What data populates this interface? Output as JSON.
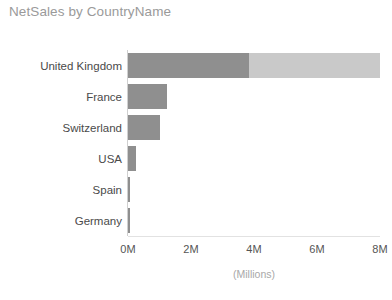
{
  "chart_data": {
    "type": "bar",
    "orientation": "horizontal",
    "title": "NetSales by CountryName",
    "xlabel": "(Millions)",
    "ylabel": "",
    "xlim": [
      0,
      8
    ],
    "xticks": [
      {
        "value": 0,
        "label": "0M"
      },
      {
        "value": 2,
        "label": "2M"
      },
      {
        "value": 4,
        "label": "4M"
      },
      {
        "value": 6,
        "label": "6M"
      },
      {
        "value": 8,
        "label": "8M"
      }
    ],
    "grid": false,
    "legend": "none",
    "units": "Millions",
    "categories": [
      "United Kingdom",
      "France",
      "Switzerland",
      "USA",
      "Spain",
      "Germany"
    ],
    "values": [
      8.0,
      1.25,
      1.0,
      0.26,
      0.06,
      0.05
    ],
    "series": [
      {
        "name": "NetSales (dark segment)",
        "color": "#8f8f8f",
        "values": [
          3.85,
          1.25,
          1.0,
          0.26,
          0.06,
          0.05
        ]
      },
      {
        "name": "NetSales (light segment)",
        "color": "#c9c9c9",
        "values": [
          4.15,
          0,
          0,
          0,
          0,
          0
        ]
      }
    ],
    "bars": [
      {
        "category": "United Kingdom",
        "total": 8.0,
        "dark": 3.85,
        "light": 4.15
      },
      {
        "category": "France",
        "total": 1.25,
        "dark": 1.25,
        "light": 0
      },
      {
        "category": "Switzerland",
        "total": 1.0,
        "dark": 1.0,
        "light": 0
      },
      {
        "category": "USA",
        "total": 0.26,
        "dark": 0.26,
        "light": 0
      },
      {
        "category": "Spain",
        "total": 0.06,
        "dark": 0.06,
        "light": 0
      },
      {
        "category": "Germany",
        "total": 0.05,
        "dark": 0.05,
        "light": 0
      }
    ]
  },
  "colors": {
    "bar_dark": "#8f8f8f",
    "bar_light": "#c9c9c9",
    "title_text": "#9a9a9a",
    "category_text": "#4a4a4a",
    "tick_text": "#555555",
    "axis_title_text": "#a8a8a8",
    "axis_line": "#d0d0d0",
    "background": "#ffffff"
  }
}
